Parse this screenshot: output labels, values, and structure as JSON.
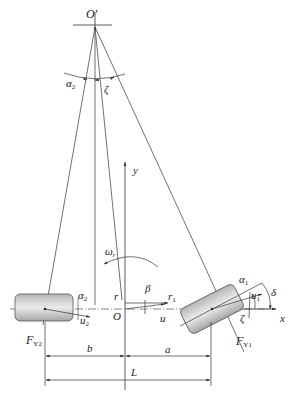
{
  "figure": {
    "type": "vehicle two-wheel (bicycle) model steering geometry",
    "labels": {
      "instant_center": "O'",
      "alpha2_top": "α",
      "alpha2_top_sub": "2",
      "zeta_top": "ζ",
      "y_axis": "y",
      "x_axis": "x",
      "yaw_rate": "ω",
      "yaw_rate_sub": "r",
      "origin": "O",
      "r": "r",
      "beta": "β",
      "r1": "r",
      "r1_sub": "1",
      "u": "u",
      "alpha1": "α",
      "alpha1_sub": "1",
      "u1": "u",
      "u1_sub": "1",
      "delta": "δ",
      "zeta_front": "ζ",
      "alpha2": "α",
      "alpha2_sub": "2",
      "u2": "u",
      "u2_sub": "2",
      "fy2": "F",
      "fy2_sub": "Y2",
      "fy1": "F",
      "fy1_sub": "Y1",
      "b": "b",
      "a": "a",
      "L": "L"
    },
    "colors": {
      "line": "#333333",
      "wheel_fill_dark": "#a8a8a8",
      "wheel_fill_light": "#e8e8e8",
      "wheel_stroke": "#555555"
    }
  }
}
